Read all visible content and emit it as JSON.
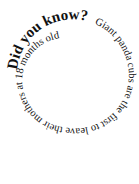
{
  "title": "Did you know?",
  "fact": "Giant panda cubs are the first to leave their mothers at 18 months old",
  "colors": {
    "text": "#111111",
    "background": "#ffffff"
  }
}
